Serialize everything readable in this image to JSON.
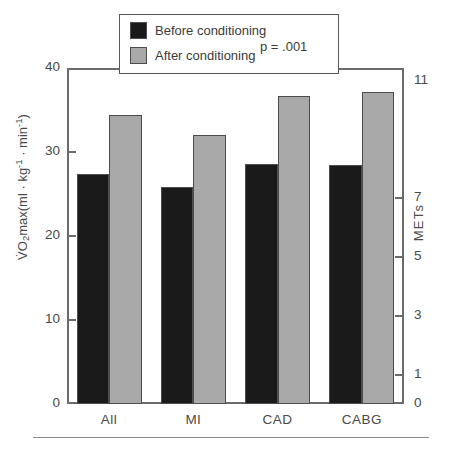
{
  "chart_data": {
    "type": "bar",
    "title": "",
    "subtitle": "",
    "xlabel": "",
    "ylabel": "VO2max(ml · kg-1 · min-1)",
    "ylabel_right": "METs",
    "categories": [
      "All",
      "MI",
      "CAD",
      "CABG"
    ],
    "series": [
      {
        "name": "Before conditioning",
        "color": "#1a1a1a",
        "values": [
          27.4,
          25.8,
          28.6,
          28.4
        ]
      },
      {
        "name": "After conditioning",
        "color": "#a8a8a8",
        "values": [
          34.4,
          32.0,
          36.7,
          37.1
        ]
      }
    ],
    "ylim": [
      0,
      40
    ],
    "yticks": [
      0,
      10,
      20,
      30,
      40
    ],
    "ytick_labels": [
      "0",
      "10",
      "20",
      "30",
      "40"
    ],
    "right_axis": {
      "label": "METs",
      "ticks_value_in_left_units": [
        0,
        3.5,
        10.5,
        17.5,
        24.5,
        38.5
      ],
      "tick_labels": [
        "0",
        "1",
        "3",
        "5",
        "7",
        "11"
      ]
    },
    "grid": false,
    "legend_position": "top-center",
    "annotations": [
      {
        "name": "p-value",
        "text": "p = .001"
      }
    ]
  },
  "axes": {
    "left": {
      "title_parts": {
        "v_dot": "V̇",
        "main_a": "O",
        "sub_2": "2",
        "main_b": "max(ml · kg",
        "sup_1a": "-1",
        "mid": " · min",
        "sup_1b": "-1",
        "close": ")"
      },
      "ticks": [
        {
          "label": "40",
          "value": 40
        },
        {
          "label": "30",
          "value": 30
        },
        {
          "label": "20",
          "value": 20
        },
        {
          "label": "10",
          "value": 10
        },
        {
          "label": "0",
          "value": 0
        }
      ]
    },
    "right": {
      "title": "METs",
      "ticks": [
        {
          "label": "11",
          "value": 11
        },
        {
          "label": "7",
          "value": 7
        },
        {
          "label": "5",
          "value": 5
        },
        {
          "label": "3",
          "value": 3
        },
        {
          "label": "1",
          "value": 1
        },
        {
          "label": "0",
          "value": 0
        }
      ]
    },
    "x": {
      "ticks": [
        {
          "label": "All"
        },
        {
          "label": "MI"
        },
        {
          "label": "CAD"
        },
        {
          "label": "CABG"
        }
      ]
    }
  },
  "legend": {
    "items": [
      {
        "label": "Before conditioning",
        "color": "#1a1a1a"
      },
      {
        "label": "After conditioning",
        "color": "#a8a8a8"
      }
    ],
    "pvalue": "p = .001"
  },
  "colors": {
    "before": "#1a1a1a",
    "after": "#a8a8a8",
    "axis": "#6b6b6b",
    "text": "#3b3b3b",
    "rule": "#8a8a8a"
  }
}
